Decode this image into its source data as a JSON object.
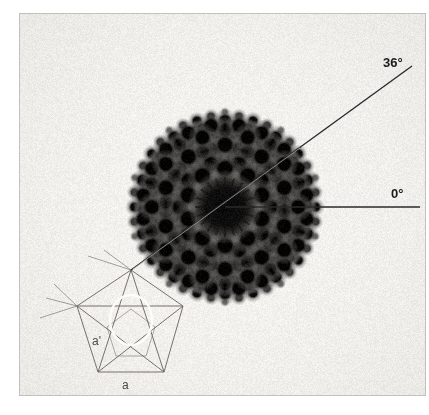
{
  "figure": {
    "kind": "electron-diffraction-pattern",
    "width": 429,
    "height": 415,
    "background_color": "#ffffff",
    "plate_color": "#f3f1ee",
    "spot_color": "#161616",
    "overlay_color": "#6e6a66",
    "axis_color": "#2a2a2a",
    "highlight_ellipse_color": "#fdfdfb"
  },
  "annotations": {
    "angle_36_label": "36°",
    "angle_0_label": "0°",
    "vector_a_prime_label": "a'",
    "vector_a_label": "a"
  },
  "chart_data": {
    "type": "scatter",
    "title": "",
    "subtitle": "",
    "xlabel": "",
    "ylabel": "",
    "xlim": [
      18,
      426
    ],
    "ylim": [
      14,
      396
    ],
    "grid": false,
    "legend": null,
    "annotations": [
      {
        "text": "36°",
        "x": 383,
        "y": 62
      },
      {
        "text": "0°",
        "x": 391,
        "y": 193
      },
      {
        "text": "a'",
        "x": 92,
        "y": 340
      },
      {
        "text": "a",
        "x": 122,
        "y": 384
      }
    ],
    "axes_overlay": [
      {
        "name": "zero-degree-axis",
        "angle_deg": 0,
        "x1": 225,
        "y1": 207,
        "x2": 420,
        "y2": 207
      },
      {
        "name": "thirty-six-degree-axis",
        "angle_deg": 36,
        "x1": 131,
        "y1": 270,
        "x2": 412,
        "y2": 66
      }
    ],
    "pentagon_vertices": [
      {
        "x": 131,
        "y": 270
      },
      {
        "x": 183,
        "y": 306
      },
      {
        "x": 164,
        "y": 372
      },
      {
        "x": 98,
        "y": 372
      },
      {
        "x": 77,
        "y": 306
      }
    ],
    "inner_pentagon_vertices": [
      {
        "x": 131,
        "y": 309
      },
      {
        "x": 155,
        "y": 327
      },
      {
        "x": 146,
        "y": 356
      },
      {
        "x": 116,
        "y": 356
      },
      {
        "x": 107,
        "y": 327
      }
    ],
    "highlight_ellipse": {
      "cx": 131,
      "cy": 320,
      "rx": 21,
      "ry": 25
    },
    "center_beam": {
      "x": 225,
      "y": 207,
      "radius": 24
    },
    "spot_radial_scale": 20.4,
    "series": [
      {
        "name": "bragg-peaks",
        "note": "Decagonal quasilattice: peaks at integer combinations of five star vectors; intensity falls with |G| and with perpendicular-space component.",
        "star_angles_deg": [
          90,
          162,
          234,
          306,
          18
        ],
        "levels": [
          {
            "scale": 1.0,
            "size": 9.0
          },
          {
            "scale": 0.618,
            "size": 6.2
          },
          {
            "scale": 0.382,
            "size": 4.2
          },
          {
            "scale": 0.236,
            "size": 2.8
          },
          {
            "scale": 1.618,
            "size": 11.0
          }
        ]
      }
    ]
  }
}
